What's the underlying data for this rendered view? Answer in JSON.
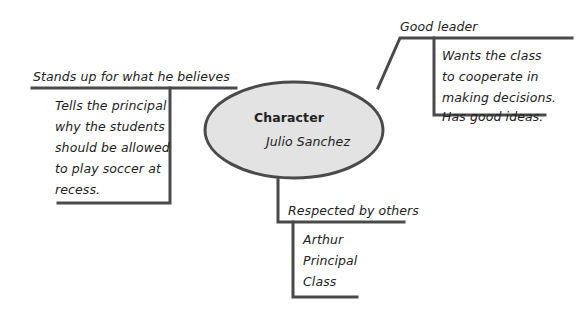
{
  "diagram": {
    "type": "character-web",
    "center": {
      "heading": "Character",
      "name": "Julio Sanchez",
      "fill": "#e3e3e3",
      "stroke": "#4a4a4a"
    },
    "branches": [
      {
        "label": "Stands up for what he believes",
        "details": [
          "Tells the principal",
          "why the students",
          "should be allowed",
          "to play soccer at",
          "recess."
        ]
      },
      {
        "label": "Good leader",
        "details": [
          "Wants the class",
          "to cooperate in",
          "making decisions.",
          "Has good ideas."
        ]
      },
      {
        "label": "Respected by others",
        "details": [
          "Arthur",
          "Principal",
          "Class"
        ]
      }
    ],
    "line_color": "#4a4a4a"
  }
}
